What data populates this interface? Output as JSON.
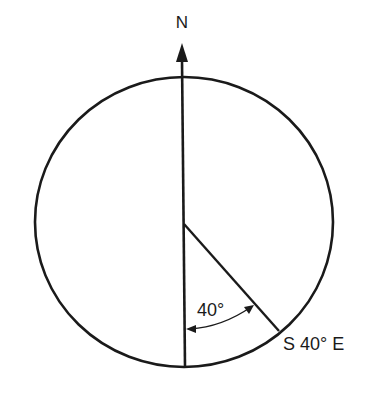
{
  "diagram": {
    "north_label": "N",
    "angle_label": "40°",
    "bearing_label": "S 40° E",
    "colors": {
      "stroke": "#1a1a1a",
      "background": "#ffffff"
    }
  }
}
